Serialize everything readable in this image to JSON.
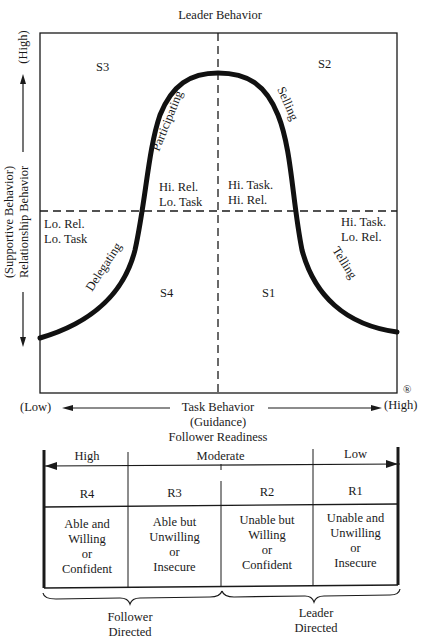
{
  "diagram": {
    "title": "Leader Behavior",
    "registered_mark": "®",
    "y_axis": {
      "label_line1": "(Supportive Behavior)",
      "label_line2": "Relationship Behavior",
      "high": "(High)"
    },
    "x_axis": {
      "low": "(Low)",
      "high": "(High)",
      "label_line1": "Task Behavior",
      "label_line2": "(Guidance)",
      "label_line3": "Follower Readiness"
    },
    "quadrants": {
      "s1": "S1",
      "s2": "S2",
      "s3": "S3",
      "s4": "S4"
    },
    "styles": {
      "delegating": "Delegating",
      "participating": "Participating",
      "selling": "Selling",
      "telling": "Telling"
    },
    "region_labels": {
      "lo_rel_lo_task": [
        "Lo. Rel.",
        "Lo. Task"
      ],
      "hi_rel_lo_task": [
        "Hi. Rel.",
        "Lo. Task"
      ],
      "hi_task_hi_rel": [
        "Hi. Task.",
        "Hi. Rel."
      ],
      "hi_task_lo_rel": [
        "Hi. Task.",
        "Lo. Rel."
      ]
    }
  },
  "readiness_table": {
    "levels": [
      "High",
      "Moderate",
      "Low"
    ],
    "columns": [
      {
        "code": "R4",
        "desc": [
          "Able and",
          "Willing",
          "or",
          "Confident"
        ]
      },
      {
        "code": "R3",
        "desc": [
          "Able but",
          "Unwilling",
          "or",
          "Insecure"
        ]
      },
      {
        "code": "R2",
        "desc": [
          "Unable but",
          "Willing",
          "or",
          "Confident"
        ]
      },
      {
        "code": "R1",
        "desc": [
          "Unable and",
          "Unwilling",
          "or",
          "Insecure"
        ]
      }
    ],
    "groups": [
      {
        "line1": "Follower",
        "line2": "Directed"
      },
      {
        "line1": "Leader",
        "line2": "Directed"
      }
    ]
  }
}
